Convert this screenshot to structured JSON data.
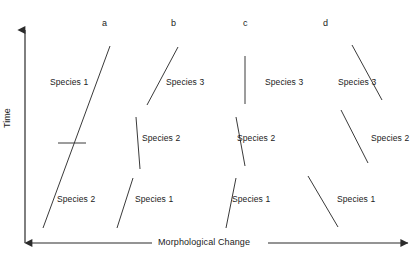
{
  "figure": {
    "background_color": "#ffffff",
    "line_color": "#3a3a3a",
    "text_color": "#1b1b1b",
    "width": 418,
    "height": 271
  },
  "axes": {
    "y": {
      "label": "Time",
      "arrow": "up",
      "x": 25,
      "y_top": 30,
      "y_bottom": 243
    },
    "x": {
      "label": "Morphological Change",
      "arrow": "both",
      "y": 243,
      "x_left": 32,
      "x_right": 408,
      "label_x": 210,
      "label_y": 243
    }
  },
  "columns": [
    {
      "letter": "a",
      "x": 102,
      "y": 19
    },
    {
      "letter": "b",
      "x": 171,
      "y": 19
    },
    {
      "letter": "c",
      "x": 243,
      "y": 19
    },
    {
      "letter": "d",
      "x": 323,
      "y": 19
    }
  ],
  "species_labels": [
    {
      "text": "Species 1",
      "x": 50,
      "y": 83,
      "column": "a"
    },
    {
      "text": "Species 2",
      "x": 57,
      "y": 200,
      "column": "a"
    },
    {
      "text": "Species 3",
      "x": 166,
      "y": 83,
      "column": "b"
    },
    {
      "text": "Species 2",
      "x": 142,
      "y": 139,
      "column": "b"
    },
    {
      "text": "Species 1",
      "x": 135,
      "y": 200,
      "column": "b"
    },
    {
      "text": "Species 3",
      "x": 265,
      "y": 83,
      "column": "c"
    },
    {
      "text": "Species 2",
      "x": 237,
      "y": 139,
      "column": "c"
    },
    {
      "text": "Species 1",
      "x": 232,
      "y": 200,
      "column": "c"
    },
    {
      "text": "Species 3",
      "x": 338,
      "y": 83,
      "column": "d"
    },
    {
      "text": "Species 2",
      "x": 371,
      "y": 139,
      "column": "d"
    },
    {
      "text": "Species 1",
      "x": 337,
      "y": 200,
      "column": "d"
    }
  ],
  "lineages": [
    {
      "column": "a",
      "mode": "anagenesis",
      "segments": [
        {
          "name": "a-main-lineage",
          "x1": 43,
          "y1": 228,
          "x2": 110,
          "y2": 46
        }
      ],
      "ticks": [
        {
          "name": "a-species-boundary-tick",
          "x1": 58,
          "y1": 143,
          "x2": 86,
          "y2": 143
        }
      ]
    },
    {
      "column": "b",
      "mode": "punctuated-gradual",
      "segments": [
        {
          "name": "b-species-3",
          "x1": 147,
          "y1": 105,
          "x2": 178,
          "y2": 47
        },
        {
          "name": "b-species-2",
          "x1": 136,
          "y1": 117,
          "x2": 140,
          "y2": 169
        },
        {
          "name": "b-species-1",
          "x1": 117,
          "y1": 228,
          "x2": 133,
          "y2": 178
        }
      ],
      "ticks": []
    },
    {
      "column": "c",
      "mode": "punctuated-equilibrium",
      "segments": [
        {
          "name": "c-species-3",
          "x1": 245,
          "y1": 56,
          "x2": 245,
          "y2": 104
        },
        {
          "name": "c-species-2",
          "x1": 236,
          "y1": 117,
          "x2": 245,
          "y2": 166
        },
        {
          "name": "c-species-1",
          "x1": 226,
          "y1": 228,
          "x2": 236,
          "y2": 178
        }
      ],
      "ticks": []
    },
    {
      "column": "d",
      "mode": "reversal",
      "segments": [
        {
          "name": "d-species-3",
          "x1": 352,
          "y1": 45,
          "x2": 382,
          "y2": 100
        },
        {
          "name": "d-species-2",
          "x1": 341,
          "y1": 110,
          "x2": 368,
          "y2": 163
        },
        {
          "name": "d-species-1",
          "x1": 308,
          "y1": 176,
          "x2": 338,
          "y2": 227
        }
      ],
      "ticks": []
    }
  ]
}
